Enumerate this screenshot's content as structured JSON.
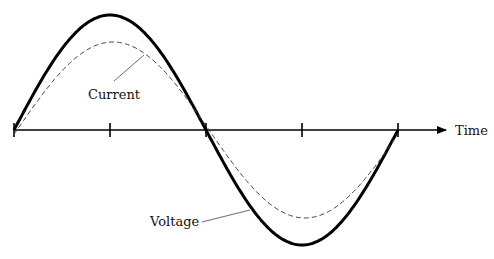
{
  "diagram": {
    "title": "",
    "axis_label": "Time",
    "labels": {
      "current": "Current",
      "voltage": "Voltage"
    },
    "axis": {
      "y": 130,
      "x_start": 14,
      "x_end": 448,
      "ticks_x": [
        14,
        110,
        206,
        302,
        398
      ]
    },
    "series": [
      {
        "name": "Voltage",
        "style": "solid-thick",
        "amplitude_px": 115,
        "phase_offset_px": 0,
        "color": "#000000"
      },
      {
        "name": "Current",
        "style": "dashed-thin",
        "amplitude_px": 88,
        "phase_offset_px": 3,
        "color": "#333333"
      }
    ]
  }
}
